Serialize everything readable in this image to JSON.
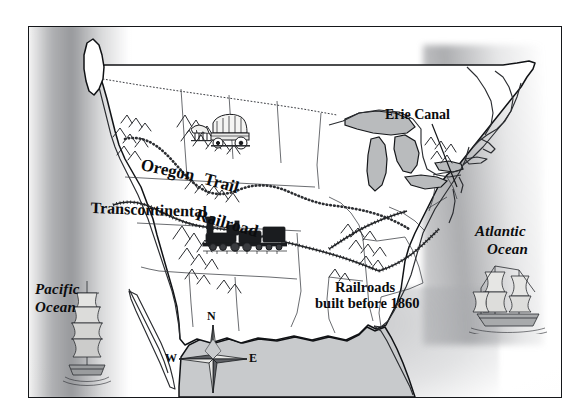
{
  "map": {
    "title": "United States — Westward Expansion and Transportation Routes",
    "frame": {
      "border_color": "#15171a",
      "background": "#fefefe"
    },
    "labels": {
      "pacific_ocean": "Pacific\nOcean",
      "pacific_ocean_line1": "Pacific",
      "pacific_ocean_line2": "Ocean",
      "atlantic_ocean_line1": "Atlantic",
      "atlantic_ocean_line2": "Ocean",
      "erie_canal": "Erie Canal",
      "railroads_line1": "Railroads",
      "railroads_line2": "built before 1860",
      "oregon": "Oregon",
      "trail": "Trail",
      "transcontinental": "Transcontinental",
      "railroad": "Railroad"
    },
    "compass": {
      "north": "N",
      "south": "S",
      "east": "E",
      "west": "W"
    },
    "illustrations": {
      "covered_wagon": "covered-wagon",
      "locomotive": "steam-locomotive",
      "pacific_ship": "sailing-ship",
      "atlantic_ship": "sailing-ship"
    },
    "colors": {
      "ink": "#0b0c0e",
      "coastline": "#101215",
      "lake_fill": "#b9bbbd",
      "gulf_fill": "#c8cacc",
      "ocean_shade": "#62646b",
      "paper": "#fefefe"
    },
    "route_legend": {
      "oregon_trail_style": "beaded dotted line",
      "railroad_style": "hatched rail line",
      "national_border_style": "fine dotted line"
    }
  }
}
